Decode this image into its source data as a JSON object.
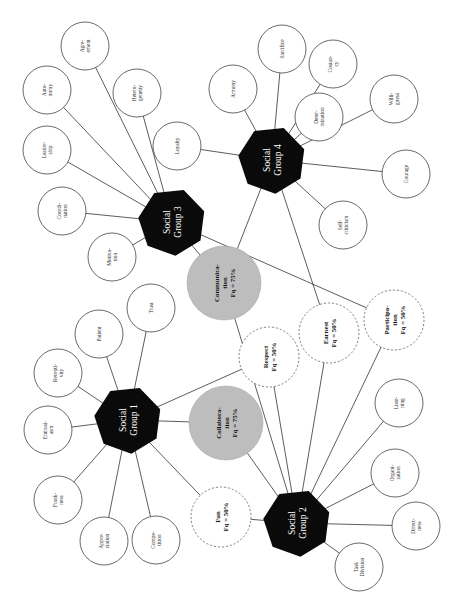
{
  "diagram": {
    "type": "network",
    "orientation": "rotated-90-ccw",
    "colors": {
      "group_fill": "#0a0a0a",
      "group_text": "#ffffff",
      "shared_75_fill": "#bdbdbd",
      "leaf_stroke": "#444444",
      "edge": "#333333"
    },
    "groups": [
      {
        "id": "g1",
        "label_line1": "Social",
        "label_line2": "Group 1",
        "x": 128,
        "y": 420
      },
      {
        "id": "g2",
        "label_line1": "Social",
        "label_line2": "Group 2",
        "x": 297,
        "y": 523
      },
      {
        "id": "g3",
        "label_line1": "Social",
        "label_line2": "Group 3",
        "x": 172,
        "y": 222
      },
      {
        "id": "g4",
        "label_line1": "Social",
        "label_line2": "Group 4",
        "x": 272,
        "y": 160
      }
    ],
    "shared_nodes": [
      {
        "id": "communication",
        "lines": [
          "Communica-",
          "tion",
          "Fq = 75%"
        ],
        "style": "grey",
        "x": 224,
        "y": 283,
        "r": 37,
        "connects": [
          "g3",
          "g4",
          "g2"
        ]
      },
      {
        "id": "collaboration",
        "lines": [
          "Collabora-",
          "tion",
          "Fq = 75%"
        ],
        "style": "grey",
        "x": 226,
        "y": 423,
        "r": 37,
        "connects": [
          "g1",
          "g2"
        ]
      },
      {
        "id": "respect",
        "lines": [
          "Respect",
          "Fq = 50%"
        ],
        "style": "dashed",
        "x": 269,
        "y": 357,
        "r": 30,
        "connects": [
          "g1",
          "g2"
        ]
      },
      {
        "id": "earnest",
        "lines": [
          "Earnest",
          "Fq = 50%"
        ],
        "style": "dashed",
        "x": 329,
        "y": 333,
        "r": 30,
        "connects": [
          "g4",
          "g2"
        ]
      },
      {
        "id": "participation",
        "lines": [
          "Participa-",
          "tion",
          "Fq = 50%"
        ],
        "style": "dashed",
        "x": 394,
        "y": 320,
        "r": 30,
        "connects": [
          "g3",
          "g2"
        ]
      },
      {
        "id": "fun",
        "lines": [
          "Fun",
          "Fq = 50%"
        ],
        "style": "dashed",
        "x": 221,
        "y": 517,
        "r": 30,
        "connects": [
          "g1",
          "g2"
        ]
      }
    ],
    "leaves": [
      {
        "group": "g3",
        "lines": [
          "Agre-",
          "ement"
        ],
        "x": 85,
        "y": 46
      },
      {
        "group": "g3",
        "lines": [
          "Auto-",
          "nomy"
        ],
        "x": 47,
        "y": 90
      },
      {
        "group": "g3",
        "lines": [
          "Hetero-",
          "geneity"
        ],
        "x": 137,
        "y": 93
      },
      {
        "group": "g3",
        "lines": [
          "Leader-",
          "ship"
        ],
        "x": 47,
        "y": 150
      },
      {
        "group": "g3",
        "lines": [
          "Coordi-",
          "nation"
        ],
        "x": 62,
        "y": 211
      },
      {
        "group": "g3",
        "lines": [
          "Motiva-",
          "tion"
        ],
        "x": 112,
        "y": 257
      },
      {
        "group": "g4",
        "lines": [
          "Loyalty"
        ],
        "x": 177,
        "y": 146
      },
      {
        "group": "g4",
        "lines": [
          "Armony"
        ],
        "x": 233,
        "y": 89
      },
      {
        "group": "g4",
        "lines": [
          "Sacrifice"
        ],
        "x": 282,
        "y": 49
      },
      {
        "group": "g4",
        "lines": [
          "Costan-",
          "cy"
        ],
        "x": 333,
        "y": 64
      },
      {
        "group": "g4",
        "lines": [
          "Deter-",
          "mination"
        ],
        "x": 319,
        "y": 117
      },
      {
        "group": "g4",
        "lines": [
          "Willi-",
          "gness"
        ],
        "x": 394,
        "y": 99
      },
      {
        "group": "g4",
        "lines": [
          "Courage"
        ],
        "x": 406,
        "y": 174
      },
      {
        "group": "g4",
        "lines": [
          "Self-",
          "criticism"
        ],
        "x": 343,
        "y": 225
      },
      {
        "group": "g1",
        "lines": [
          "Trust"
        ],
        "x": 151,
        "y": 308
      },
      {
        "group": "g1",
        "lines": [
          "Patient"
        ],
        "x": 99,
        "y": 334
      },
      {
        "group": "g1",
        "lines": [
          "Recepti-",
          "vity"
        ],
        "x": 58,
        "y": 373
      },
      {
        "group": "g1",
        "lines": [
          "Enthusi-",
          "asm"
        ],
        "x": 48,
        "y": 430
      },
      {
        "group": "g1",
        "lines": [
          "Frank-",
          "ness"
        ],
        "x": 58,
        "y": 500
      },
      {
        "group": "g1",
        "lines": [
          "Appre-",
          "ciation"
        ],
        "x": 104,
        "y": 541
      },
      {
        "group": "g1",
        "lines": [
          "Compe-",
          "tition"
        ],
        "x": 156,
        "y": 540
      },
      {
        "group": "g2",
        "lines": [
          "Liste-",
          "ning"
        ],
        "x": 399,
        "y": 403
      },
      {
        "group": "g2",
        "lines": [
          "Organi-",
          "zation"
        ],
        "x": 395,
        "y": 473
      },
      {
        "group": "g2",
        "lines": [
          "Direct-",
          "ness"
        ],
        "x": 416,
        "y": 526
      },
      {
        "group": "g2",
        "lines": [
          "Task",
          "Division"
        ],
        "x": 359,
        "y": 567
      }
    ]
  }
}
